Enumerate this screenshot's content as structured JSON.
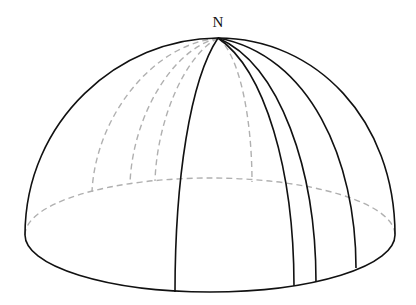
{
  "diagram": {
    "labels": {
      "north_pole": "N"
    },
    "colors": {
      "solid_line": "#111111",
      "hidden_line": "#b0b0b0",
      "background": "#ffffff"
    },
    "pole": {
      "x": 218,
      "y": 38
    },
    "base_ellipse": {
      "cx": 210,
      "cy": 235,
      "rx": 185,
      "ry": 57
    },
    "visible_meridians_bottom": [
      {
        "x": 175,
        "y": 292
      },
      {
        "x": 294,
        "y": 286
      },
      {
        "x": 316,
        "y": 282
      },
      {
        "x": 356,
        "y": 268
      }
    ],
    "hidden_meridians_bottom": [
      {
        "x": 92,
        "y": 192
      },
      {
        "x": 130,
        "y": 184
      },
      {
        "x": 155,
        "y": 181
      },
      {
        "x": 252,
        "y": 182
      }
    ]
  }
}
